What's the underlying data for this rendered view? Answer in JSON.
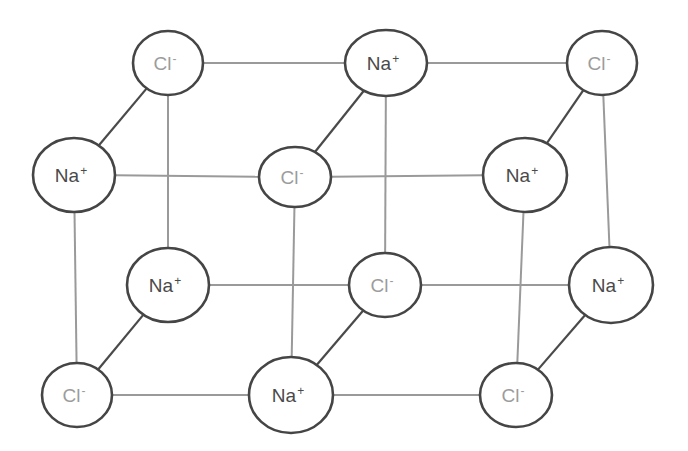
{
  "diagram": {
    "title": "",
    "colors": {
      "background": "#ffffff",
      "ion_outline": "#454545",
      "grid_line": "#9a9a9a",
      "depth_line": "#4a4a4a",
      "na_text": "#4a4a4a",
      "cl_text": "#9c9c9c"
    },
    "nodes": [
      {
        "id": "n0",
        "element": "Cl",
        "charge": "-",
        "cx": 168,
        "cy": 63,
        "rx": 35,
        "ry": 32,
        "layer": "back-top"
      },
      {
        "id": "n1",
        "element": "Na",
        "charge": "+",
        "cx": 386,
        "cy": 63,
        "rx": 41,
        "ry": 33,
        "layer": "back-top"
      },
      {
        "id": "n2",
        "element": "Cl",
        "charge": "-",
        "cx": 602,
        "cy": 63,
        "rx": 35,
        "ry": 32,
        "layer": "back-top"
      },
      {
        "id": "n3",
        "element": "Na",
        "charge": "+",
        "cx": 74,
        "cy": 175,
        "rx": 41,
        "ry": 37,
        "layer": "front-top"
      },
      {
        "id": "n4",
        "element": "Cl",
        "charge": "-",
        "cx": 295,
        "cy": 177,
        "rx": 36,
        "ry": 30,
        "layer": "front-top"
      },
      {
        "id": "n5",
        "element": "Na",
        "charge": "+",
        "cx": 525,
        "cy": 175,
        "rx": 42,
        "ry": 37,
        "layer": "front-top"
      },
      {
        "id": "n6",
        "element": "Na",
        "charge": "+",
        "cx": 168,
        "cy": 285,
        "rx": 41,
        "ry": 37,
        "layer": "back-bottom"
      },
      {
        "id": "n7",
        "element": "Cl",
        "charge": "-",
        "cx": 385,
        "cy": 285,
        "rx": 36,
        "ry": 32,
        "layer": "back-bottom"
      },
      {
        "id": "n8",
        "element": "Na",
        "charge": "+",
        "cx": 611,
        "cy": 285,
        "rx": 42,
        "ry": 38,
        "layer": "back-bottom"
      },
      {
        "id": "n9",
        "element": "Cl",
        "charge": "-",
        "cx": 77,
        "cy": 395,
        "rx": 35,
        "ry": 32,
        "layer": "front-bottom"
      },
      {
        "id": "n10",
        "element": "Na",
        "charge": "+",
        "cx": 291,
        "cy": 395,
        "rx": 42,
        "ry": 38,
        "layer": "front-bottom"
      },
      {
        "id": "n11",
        "element": "Cl",
        "charge": "-",
        "cx": 516,
        "cy": 395,
        "rx": 36,
        "ry": 32,
        "layer": "front-bottom"
      }
    ],
    "grid_edges": [
      [
        "n0",
        "n1"
      ],
      [
        "n1",
        "n2"
      ],
      [
        "n3",
        "n4"
      ],
      [
        "n4",
        "n5"
      ],
      [
        "n6",
        "n7"
      ],
      [
        "n7",
        "n8"
      ],
      [
        "n9",
        "n10"
      ],
      [
        "n10",
        "n11"
      ],
      [
        "n0",
        "n6"
      ],
      [
        "n1",
        "n7"
      ],
      [
        "n2",
        "n8"
      ],
      [
        "n3",
        "n9"
      ],
      [
        "n4",
        "n10"
      ],
      [
        "n5",
        "n11"
      ]
    ],
    "depth_edges": [
      [
        "n0",
        "n3"
      ],
      [
        "n1",
        "n4"
      ],
      [
        "n2",
        "n5"
      ],
      [
        "n6",
        "n9"
      ],
      [
        "n7",
        "n10"
      ],
      [
        "n8",
        "n11"
      ]
    ],
    "labels": {
      "na": "Na",
      "cl": "Cl",
      "plus": "+",
      "minus": "-"
    }
  }
}
